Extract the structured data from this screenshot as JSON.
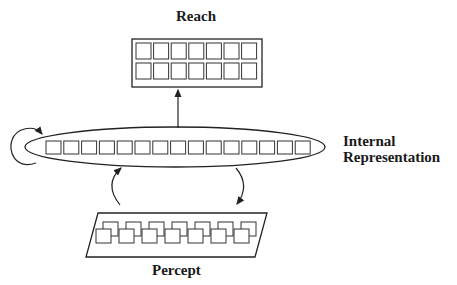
{
  "diagram": {
    "labels": {
      "reach": "Reach",
      "internal_line1": "Internal",
      "internal_line2": "Representation",
      "percept": "Percept"
    },
    "reach_grid": {
      "rows": 2,
      "cols": 7
    },
    "internal_row": {
      "count": 15
    },
    "percept_row": {
      "count": 7,
      "style": "overlapping-pairs"
    },
    "connections": [
      {
        "from": "internal-representation",
        "to": "reach",
        "type": "straight-arrow"
      },
      {
        "from": "internal-representation",
        "to": "internal-representation",
        "type": "self-loop"
      },
      {
        "from": "percept",
        "to": "internal-representation",
        "type": "curved-arrow"
      },
      {
        "from": "internal-representation",
        "to": "percept",
        "type": "curved-arrow"
      }
    ],
    "colors": {
      "stroke": "#222222",
      "background": "#ffffff"
    }
  }
}
